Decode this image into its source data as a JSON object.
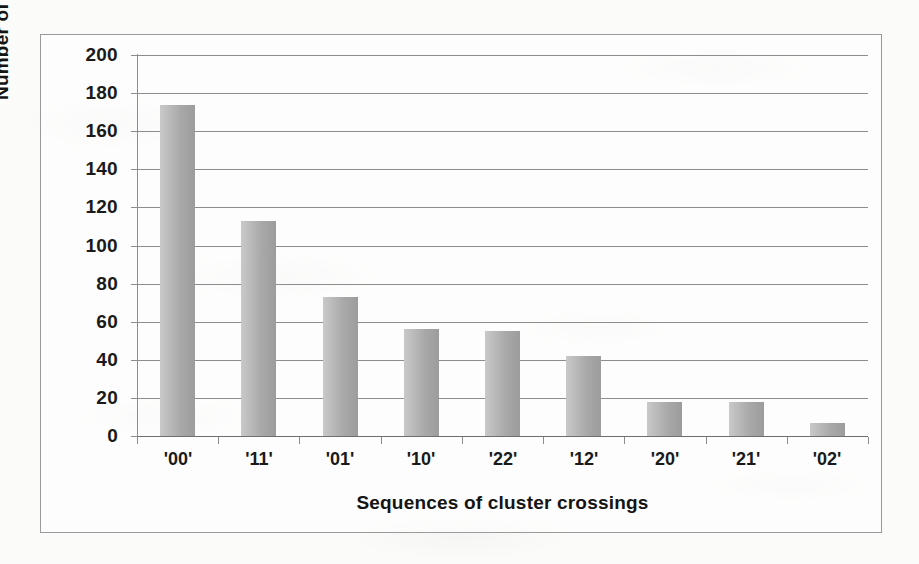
{
  "chart_data": {
    "type": "bar",
    "title": "",
    "xlabel": "Sequences of cluster crossings",
    "ylabel": "Number of crossings",
    "categories": [
      "'00'",
      "'11'",
      "'01'",
      "'10'",
      "'22'",
      "'12'",
      "'20'",
      "'21'",
      "'02'"
    ],
    "values": [
      174,
      113,
      73,
      56,
      55,
      42,
      18,
      18,
      7
    ],
    "ylim": [
      0,
      200
    ],
    "yticks": [
      0,
      20,
      40,
      60,
      80,
      100,
      120,
      140,
      160,
      180,
      200
    ],
    "ytick_labels": [
      "0",
      "20",
      "40",
      "60",
      "80",
      "100",
      "120",
      "140",
      "160",
      "180",
      "200"
    ],
    "grid": true,
    "grid_axis": "y",
    "legend": false,
    "bar_color": "#ababab",
    "axis_color": "#8d8d8d",
    "text_color": "#1a1a1a",
    "background": "#fbfbfa"
  }
}
